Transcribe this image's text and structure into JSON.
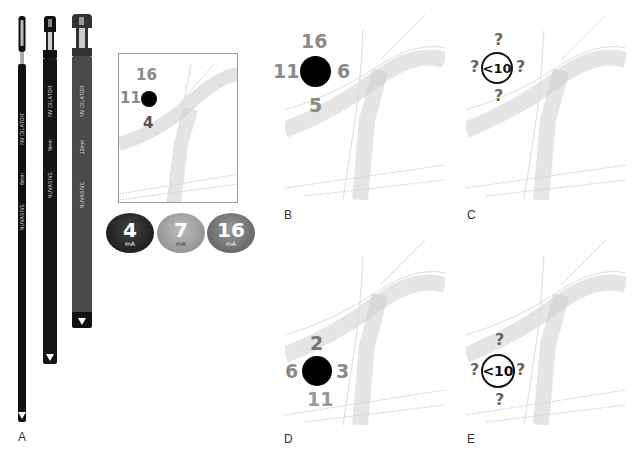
{
  "panels": {
    "A": {
      "label": "A"
    },
    "B": {
      "label": "B"
    },
    "C": {
      "label": "C"
    },
    "D": {
      "label": "D"
    },
    "E": {
      "label": "E"
    }
  },
  "dilators": [
    {
      "brand": "NUVASIVE",
      "model": "NV DILATOR",
      "size": "6mm",
      "marker": "③",
      "color": "#111111"
    },
    {
      "brand": "NUVASIVE",
      "model": "NV DILATOR",
      "size": "9mm",
      "marker": "③",
      "color": "#1a1a1a"
    },
    {
      "brand": "NUVASIVE",
      "model": "NV DILATOR",
      "size": "12mm",
      "marker": "③",
      "color": "#4a4a4a"
    }
  ],
  "inset": {
    "top": "16",
    "left": "11",
    "bottom": "4"
  },
  "badges": [
    {
      "value": "4",
      "unit": "mA",
      "color": "#1e1e1e"
    },
    {
      "value": "7",
      "unit": "mA",
      "color": "#9a9a9a"
    },
    {
      "value": "16",
      "unit": "mA",
      "color": "#6e6e6e"
    }
  ],
  "panelB": {
    "top": "16",
    "left": "11",
    "right": "6",
    "bottom": "5"
  },
  "panelC": {
    "center": "<10",
    "top": "?",
    "left": "?",
    "right": "?",
    "bottom": "?"
  },
  "panelD": {
    "top": "2",
    "left": "6",
    "right": "3",
    "bottom": "11"
  },
  "panelE": {
    "center": "<10",
    "top": "?",
    "left": "?",
    "right": "?",
    "bottom": "?"
  }
}
